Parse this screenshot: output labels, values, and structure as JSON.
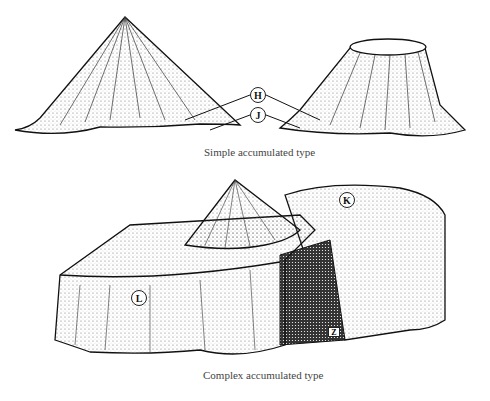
{
  "figure": {
    "top_panel": {
      "caption": "Simple accumulated type",
      "labels": {
        "H": "H",
        "J": "J"
      }
    },
    "bottom_panel": {
      "caption": "Complex accumulated type",
      "labels": {
        "K": "K",
        "L": "L"
      },
      "marker": "Z"
    }
  }
}
